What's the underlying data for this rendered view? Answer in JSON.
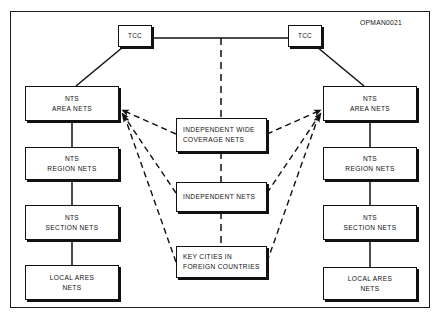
{
  "diagram": {
    "doc_code": "OPMAN0021",
    "colors": {
      "line": "#111111",
      "frame": "#1a1a1a",
      "background": "#ffffff"
    },
    "nodes": {
      "tcc_left": {
        "lines": [
          "TCC"
        ]
      },
      "tcc_right": {
        "lines": [
          "TCC"
        ]
      },
      "left_area": {
        "lines": [
          "NTS",
          "AREA NETS"
        ]
      },
      "left_region": {
        "lines": [
          "NTS",
          "REGION NETS"
        ]
      },
      "left_section": {
        "lines": [
          "NTS",
          "SECTION NETS"
        ]
      },
      "left_local": {
        "lines": [
          "LOCAL ARES",
          "NETS"
        ]
      },
      "right_area": {
        "lines": [
          "NTS",
          "AREA NETS"
        ]
      },
      "right_region": {
        "lines": [
          "NTS",
          "REGION NETS"
        ]
      },
      "right_section": {
        "lines": [
          "NTS",
          "SECTION NETS"
        ]
      },
      "right_local": {
        "lines": [
          "LOCAL ARES",
          "NETS"
        ]
      },
      "center_wide": {
        "lines": [
          "INDEPENDENT WIDE",
          "COVERAGE NETS"
        ]
      },
      "center_independent": {
        "lines": [
          "INDEPENDENT NETS"
        ]
      },
      "center_keycities": {
        "lines": [
          "KEY CITIES IN",
          "FOREIGN COUNTRIES"
        ]
      }
    },
    "connections": [
      {
        "from": "tcc_left",
        "to": "tcc_right",
        "style": "solid"
      },
      {
        "from": "tcc_left",
        "to": "left_area",
        "style": "solid"
      },
      {
        "from": "tcc_right",
        "to": "right_area",
        "style": "solid"
      },
      {
        "from": "left_area",
        "to": "left_region",
        "style": "solid"
      },
      {
        "from": "left_region",
        "to": "left_section",
        "style": "solid"
      },
      {
        "from": "left_section",
        "to": "left_local",
        "style": "solid"
      },
      {
        "from": "right_area",
        "to": "right_region",
        "style": "solid"
      },
      {
        "from": "right_region",
        "to": "right_section",
        "style": "solid"
      },
      {
        "from": "right_section",
        "to": "right_local",
        "style": "solid"
      },
      {
        "from": "center_wide",
        "to": "left_area",
        "style": "dashed-arrow"
      },
      {
        "from": "center_wide",
        "to": "right_area",
        "style": "dashed-arrow"
      },
      {
        "from": "center_independent",
        "to": "left_area",
        "style": "dashed-arrow"
      },
      {
        "from": "center_independent",
        "to": "right_area",
        "style": "dashed-arrow"
      },
      {
        "from": "center_keycities",
        "to": "left_area",
        "style": "dashed-arrow"
      },
      {
        "from": "center_keycities",
        "to": "right_area",
        "style": "dashed-arrow"
      },
      {
        "from": "tcc_link",
        "to": "center_wide",
        "style": "dashed"
      },
      {
        "from": "center_wide",
        "to": "center_independent",
        "style": "dashed"
      },
      {
        "from": "center_independent",
        "to": "center_keycities",
        "style": "dashed"
      }
    ]
  }
}
